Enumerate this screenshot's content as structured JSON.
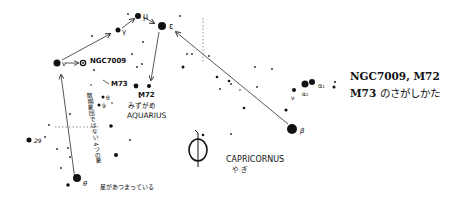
{
  "caption": {
    "line1": "NGC7009,  M72",
    "line2_prefix": "M73",
    "line2_suffix": " のさがしかた"
  },
  "labels": {
    "mu": "μ",
    "eps": "ε",
    "gamma": "γ",
    "nu_aqr": "ν",
    "ngc7009": "NGC7009",
    "m73": "M73",
    "m72": "M72",
    "aquarius_jp": "みずがめ",
    "aquarius": "AQUARIUS",
    "theta_small": "θ",
    "nine": "9",
    "twenty_nine": "29",
    "theta": "θ",
    "nu_cap": "ν",
    "alpha1": "α₁",
    "alpha2": "α₂",
    "beta": "β",
    "capricornus": "CAPRICORNUS",
    "capricornus_jp": "や ぎ",
    "note_vertical": "散開星団ではない 4つの星",
    "note_bottom": "星があつまっている"
  },
  "symbols": {
    "saturn_glyph": "saturn-symbol"
  },
  "colors": {
    "ink": "#111111",
    "line": "#555555",
    "background": "#ffffff"
  }
}
